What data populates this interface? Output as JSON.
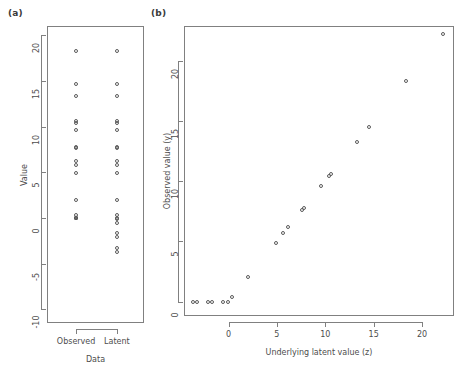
{
  "figure": {
    "panel_a_label": "(a)",
    "panel_b_label": "(b)"
  },
  "chart_data": [
    {
      "type": "scatter",
      "panel": "(a)",
      "title": "",
      "xlabel": "Data",
      "ylabel": "Value",
      "categories": [
        "Observed",
        "Latent"
      ],
      "xtick_labels": [
        "Observed",
        "Latent"
      ],
      "ylim": [
        -11.5,
        21.0
      ],
      "yticks": [
        -10,
        -5,
        0,
        5,
        10,
        15,
        20
      ],
      "ytick_labels": [
        "-10",
        "-5",
        "0",
        "5",
        "10",
        "15",
        "20"
      ],
      "grid": false,
      "legend": "none",
      "series": [
        {
          "name": "Observed",
          "x_category": "Observed",
          "values": [
            18.3,
            14.6,
            13.3,
            10.6,
            10.4,
            9.6,
            7.8,
            7.6,
            6.2,
            5.8,
            4.9,
            2.0,
            0.35,
            0.0,
            0.0,
            0.0,
            0.0,
            0.0,
            0.0,
            0.0
          ]
        },
        {
          "name": "Latent",
          "x_category": "Latent",
          "values": [
            18.3,
            14.6,
            13.3,
            10.6,
            10.4,
            9.6,
            7.8,
            7.6,
            6.2,
            5.8,
            4.9,
            2.0,
            0.35,
            -0.1,
            -0.6,
            -1.7,
            -2.1,
            -3.3,
            -3.7,
            -0.05
          ]
        }
      ]
    },
    {
      "type": "scatter",
      "panel": "(b)",
      "title": "",
      "xlabel": "Underlying latent value (z)",
      "ylabel": "Observed value (y)",
      "xlim": [
        -4.6,
        23.3
      ],
      "ylim": [
        -1.2,
        22.9
      ],
      "xticks": [
        0,
        5,
        10,
        15,
        20
      ],
      "xtick_labels": [
        "0",
        "5",
        "10",
        "15",
        "20"
      ],
      "yticks": [
        0,
        5,
        10,
        15,
        20
      ],
      "ytick_labels": [
        "0",
        "5",
        "10",
        "15",
        "20"
      ],
      "grid": false,
      "legend": "none",
      "points": [
        {
          "z": -3.7,
          "y": 0.0
        },
        {
          "z": -3.3,
          "y": 0.0
        },
        {
          "z": -2.1,
          "y": 0.0
        },
        {
          "z": -1.7,
          "y": 0.0
        },
        {
          "z": -0.6,
          "y": 0.0
        },
        {
          "z": -0.1,
          "y": 0.0
        },
        {
          "z": 0.35,
          "y": 0.35
        },
        {
          "z": 2.0,
          "y": 2.0
        },
        {
          "z": 4.9,
          "y": 4.9
        },
        {
          "z": 5.6,
          "y": 5.7
        },
        {
          "z": 6.1,
          "y": 6.2
        },
        {
          "z": 7.6,
          "y": 7.6
        },
        {
          "z": 7.8,
          "y": 7.8
        },
        {
          "z": 9.6,
          "y": 9.6
        },
        {
          "z": 10.4,
          "y": 10.4
        },
        {
          "z": 10.6,
          "y": 10.6
        },
        {
          "z": 13.3,
          "y": 13.3
        },
        {
          "z": 14.5,
          "y": 14.5
        },
        {
          "z": 18.3,
          "y": 18.3
        },
        {
          "z": 22.2,
          "y": 22.2
        }
      ]
    }
  ]
}
